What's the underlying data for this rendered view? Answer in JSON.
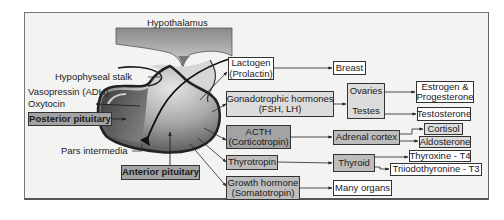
{
  "diagram": {
    "title": "Hypothalamus",
    "labels": {
      "hypophyseal_stalk": "Hypophyseal stalk",
      "vasopressin": "Vasopressin (ADH)",
      "oxytocin": "Oxytocin",
      "pars_intermedia": "Pars intermedia"
    },
    "lobes": {
      "posterior": "Posterior pituitary",
      "anterior": "Anterior pituitary"
    },
    "anterior_hormones": [
      {
        "line1": "Lactogen",
        "line2": "(Prolactin)"
      },
      {
        "line1": "Gonadotrophic hormones",
        "line2": "(FSH, LH)"
      },
      {
        "line1": "ACTH",
        "line2": "(Corticotropin)"
      },
      {
        "line1": "Thyrotropin",
        "line2": ""
      },
      {
        "line1": "Growth hormone",
        "line2": "(Somatotropin)"
      }
    ],
    "targets": {
      "breast": "Breast",
      "ovaries": "Ovaries",
      "testes": "Testes",
      "adrenal_cortex": "Adrenal cortex",
      "thyroid": "Thyroid",
      "many_organs": "Many organs"
    },
    "products": {
      "estrogen_line1": "Estrogen &",
      "estrogen_line2": "Progesterone",
      "testosterone": "Testosterone",
      "cortisol": "Cortisol",
      "aldosterone": "Aldosterone",
      "thyroxine": "Thyroxine - T4",
      "triiodothyronine": "Triiodothyronine - T3"
    },
    "colors": {
      "frame_bg": "#f3f3f2",
      "box_dark": "#a3a3a3",
      "box_mid": "#bdbdbd",
      "box_light": "#dcdcdc",
      "gland_dark": "#3a3a3a",
      "gland_light": "#cfcfcf"
    }
  }
}
